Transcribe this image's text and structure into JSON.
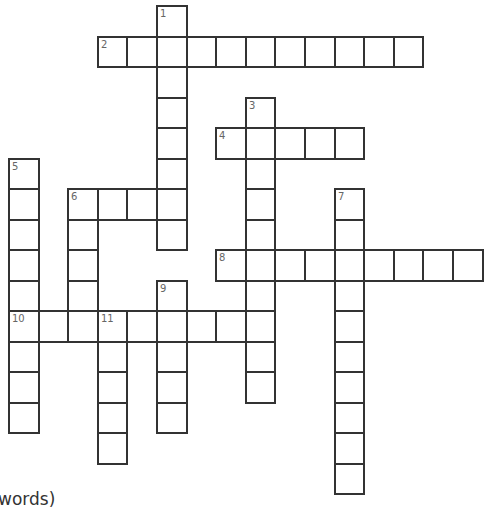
{
  "puzzle": {
    "geometry": {
      "origin_x": 8,
      "origin_y": 5,
      "cell_w": 29.6,
      "cell_h": 30.5
    },
    "words": [
      {
        "number": "1",
        "direction": "down",
        "row": 0,
        "col": 5,
        "length": 8
      },
      {
        "number": "2",
        "direction": "across",
        "row": 1,
        "col": 3,
        "length": 11
      },
      {
        "number": "3",
        "direction": "down",
        "row": 3,
        "col": 8,
        "length": 10
      },
      {
        "number": "4",
        "direction": "across",
        "row": 4,
        "col": 7,
        "length": 5
      },
      {
        "number": "5",
        "direction": "down",
        "row": 5,
        "col": 0,
        "length": 9
      },
      {
        "number": "6",
        "direction": "across",
        "row": 6,
        "col": 2,
        "length": 4
      },
      {
        "number": "6",
        "direction": "down",
        "row": 6,
        "col": 2,
        "length": 5
      },
      {
        "number": "7",
        "direction": "down",
        "row": 6,
        "col": 11,
        "length": 10
      },
      {
        "number": "8",
        "direction": "across",
        "row": 8,
        "col": 7,
        "length": 9
      },
      {
        "number": "9",
        "direction": "down",
        "row": 9,
        "col": 5,
        "length": 5
      },
      {
        "number": "10",
        "direction": "across",
        "row": 10,
        "col": 0,
        "length": 9
      },
      {
        "number": "11",
        "direction": "down",
        "row": 10,
        "col": 3,
        "length": 5
      }
    ]
  },
  "footer": {
    "text": "words)"
  }
}
